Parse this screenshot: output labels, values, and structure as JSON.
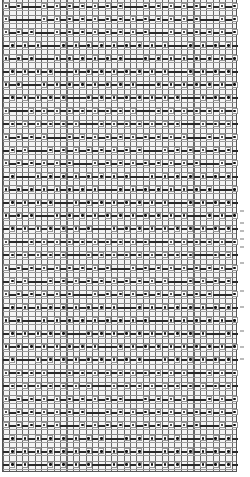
{
  "chart": {
    "columns": 37,
    "rows": 36,
    "cell_width_px": 6.35,
    "row_height_px": 13.1,
    "colors": {
      "background": "#f4f4f4",
      "grid_line": "#6a6a6a",
      "dash": "#2b2b2b",
      "dot": "#111111"
    },
    "legend_symbols": [
      "dot",
      "dash"
    ],
    "pattern": [
      "D-D---D-D-D-D-D-D-D---D-D-D-D-D-D-D-D",
      "D-----D-D-D-D-D-D-D-D-D-D-D-D-D---D-D",
      "D-D-D---D-D-D-D-D-D-D-D---D-D-D-D-D-D",
      "-D-D-D---D-D-D-D-D-D-D-D-D---D-D-D-D-",
      "D-D-D---D-D-D-D-D-D---D-D-D-D-D-D-D-D",
      "-D-D-D-D---D-D-D-D-D-D-D-D---D-D-D-D-",
      "D-D---D-D-D-D-D-D-D-D---D-D-D-D-D-D-D",
      "-D-D-D-D-D---D-D-D-D-D-D-D-D---D-D-D-",
      "D---D-D-D-D-D-D-D-D-D---D-D-D-D-D-D-D",
      "-D-D-D-D-D-D---D-D-D-D-D-D-D---D-D-D-",
      "D-D-D-D---D-D-D-D-D-D-D-D-D-D---D-D-D",
      "-D-D---D-D-D-D-D-D-D-D---D-D-D-D-D-D-",
      "D-D-D-D-D-D---D-D-D-D-D-D-D-D-D---D-D",
      "-D---D-D-D-D-D-D-D-D---D-D-D-D-D-D-D-",
      "D-D-D-D-D-D-D-D---D-D-D-D-D-D-D-D---D",
      "-D-D-D-D---D-D-D-D-D-D-D-D---D-D-D-D-",
      "D-D-D---D-D-D-D-D-D-D-D-D-D-D---D-D-D",
      "-D-D-D-D-D-D-D---D-D-D-D-D-D-D-D-D-D-",
      "D---D-D-D-D-D-D-D-D-D-D---D-D-D-D-D-D",
      "-D-D-D-D-D---D-D-D-D-D-D-D-D-D---D-D-",
      "D-D-D-D-D-D-D-D-D---D-D-D-D-D-D-D-D-D",
      "-D-D---D-D-D-D-D-D-D-D-D-D---D-D-D-D-",
      "D-D-D-D-D-D---D-D-D-D-D-D-D-D-D-D---D",
      "-D-D-D-D-D-D-D-D-D---D-D-D-D-D-D-D-D-",
      "D-D---D-D-D-D-D-D-D-D-D---D-D-D-D-D-D",
      "-D-D-D-D-D---D-D-D-D-D-D-D-D-D-D---D-",
      "D-D-D-D-D-D-D-D---D-D-D-D-D-D-D-D-D-D",
      "-D---D-D-D-D-D-D-D-D-D---D-D-D-D-D-D-",
      "D-D-D-D---D-D-D-D-D-D-D-D-D-D---D-D-D",
      "-D-D-D-D-D-D-D---D-D-D-D-D-D-D-D-D-D-",
      "D-D-D-D-D-D-D-D-D-D---D-D-D-D---D-D-D",
      "D-D-D-D-D-D-D---D-D-D-D-D-D-D-D-D-D-D",
      "D-D-D-D-D---D-D-D-D-D-D-D-D-D-D---D-D",
      "-D-D-D-D-D-D-D-D---D-D-D-D-D---D-D-D-",
      "-D-D-D-D-D-D-D-D-D-D-D---D-D-D-D-D-D-",
      "-D-D---D-D-D-D---D-D-D-D-D-D---D-D-D-"
    ]
  },
  "edge_marks_y": [
    210,
    222,
    230,
    238,
    246,
    262,
    290,
    306,
    330,
    346,
    358
  ]
}
